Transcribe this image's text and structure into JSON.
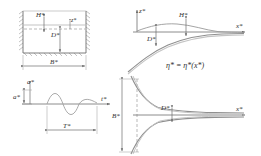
{
  "figure": {
    "background_color": "#ffffff",
    "line_color": "#6e6e6e",
    "hatch_color": "#8a8a8a",
    "text_color": "#303030",
    "width": 261,
    "height": 156
  },
  "panels": {
    "top_left": {
      "name": "rectangular-tank-cross-section",
      "labels": {
        "wave_height": "H*",
        "still_depth": "D*",
        "tank_width": "B*",
        "free_surface": "z*"
      }
    },
    "top_right": {
      "name": "side-view-converging-channel",
      "labels": {
        "vertical_axis": "z*",
        "horizontal_axis": "x*",
        "wave_height": "H*",
        "depth": "D*",
        "surface_equation": "η* = η*(x*)"
      }
    },
    "bottom_left": {
      "name": "incident-wave-time-series",
      "labels": {
        "amplitude_top": "a*",
        "amplitude_axis": "a*",
        "time_axis": "t*",
        "period": "T*"
      }
    },
    "bottom_right": {
      "name": "plan-view-horn-channel",
      "labels": {
        "inlet_width": "B*",
        "throat_width": "D*",
        "horizontal_axis": "x*"
      }
    }
  }
}
